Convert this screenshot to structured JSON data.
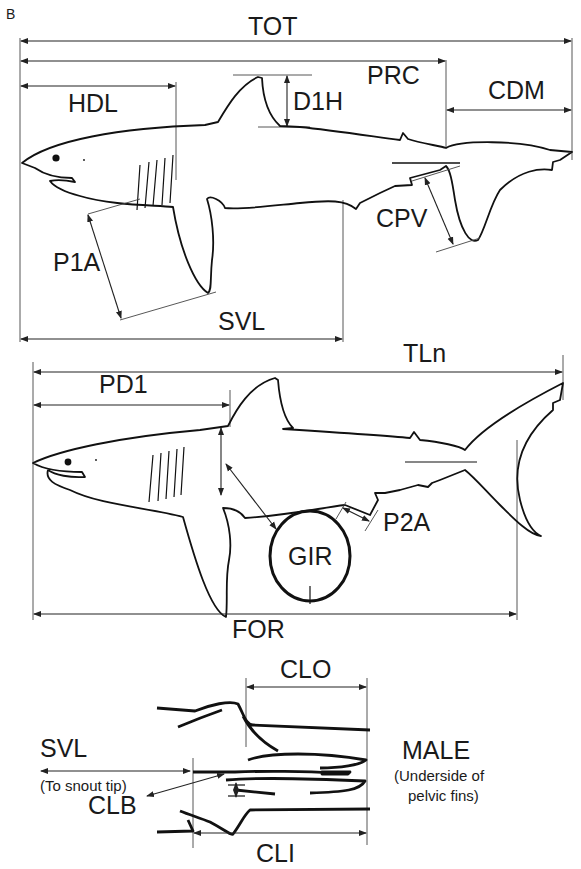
{
  "figure": {
    "panel_label": "B",
    "top_shark": {
      "labels": {
        "tot": "TOT",
        "prc": "PRC",
        "hdl": "HDL",
        "d1h": "D1H",
        "cdm": "CDM",
        "cpv": "CPV",
        "p1a": "P1A",
        "svl": "SVL"
      }
    },
    "middle_shark": {
      "labels": {
        "tln": "TLn",
        "pd1": "PD1",
        "gir": "GIR",
        "p2a": "P2A",
        "for": "FOR"
      }
    },
    "clasper_detail": {
      "labels": {
        "clo": "CLO",
        "svl": "SVL",
        "svl_note": "(To snout tip)",
        "clb": "CLB",
        "cli": "CLI",
        "sex": "MALE",
        "note_line1": "(Underside of",
        "note_line2": "pelvic fins)"
      }
    }
  }
}
